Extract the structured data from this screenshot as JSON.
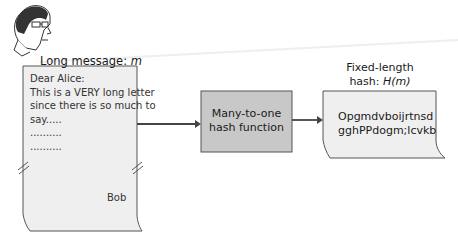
{
  "diagram": {
    "title_label": "Long message: ",
    "title_var": "m",
    "letter": {
      "lines": [
        "Dear Alice:",
        "This is a VERY long letter",
        "since there is so much to",
        "say.....",
        "..........",
        ".........."
      ],
      "signature": "Bob"
    },
    "function_box": {
      "line1": "Many-to-one",
      "line2": "hash function"
    },
    "output_label": {
      "line1": "Fixed-length",
      "line2_prefix": "hash: ",
      "line2_var": "H(m)"
    },
    "hash": {
      "line1": "Opgmdvboijrtnsd",
      "line2": "gghPPdogm;lcvkb"
    },
    "colors": {
      "box_fill": "#c8c8c8",
      "doc_fill": "#efefef",
      "stroke": "#444444"
    }
  }
}
